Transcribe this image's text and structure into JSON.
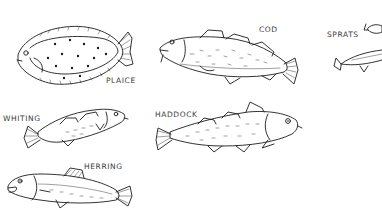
{
  "illustration": {
    "labels": {
      "plaice": "PLAICE",
      "cod": "COD",
      "sprats": "SPRATS",
      "whiting": "WHITING",
      "haddock": "HADDOCK",
      "herring": "HERRING"
    },
    "colors": {
      "ink": "#1c1c1c",
      "label": "#3a3a3a",
      "background": "#ffffff"
    }
  }
}
